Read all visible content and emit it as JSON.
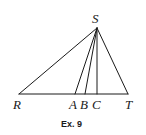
{
  "figure": {
    "caption": "Ex. 9",
    "points": {
      "S": {
        "label": "S",
        "x": 97,
        "y": 28
      },
      "R": {
        "label": "R",
        "x": 19,
        "y": 94
      },
      "A": {
        "label": "A",
        "x": 75,
        "y": 94
      },
      "B": {
        "label": "B",
        "x": 85,
        "y": 94
      },
      "C": {
        "label": "C",
        "x": 97,
        "y": 94
      },
      "T": {
        "label": "T",
        "x": 128,
        "y": 94
      }
    },
    "segments": [
      [
        "S",
        "R"
      ],
      [
        "S",
        "A"
      ],
      [
        "S",
        "B"
      ],
      [
        "S",
        "C"
      ],
      [
        "S",
        "T"
      ],
      [
        "R",
        "T"
      ]
    ],
    "line_color": "#1a1a1a"
  }
}
